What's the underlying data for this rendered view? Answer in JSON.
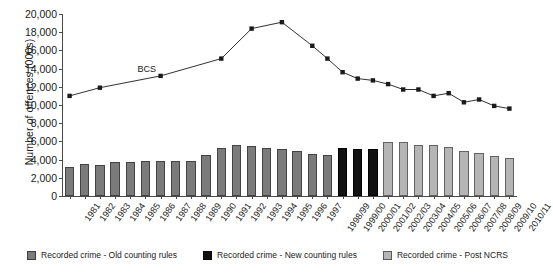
{
  "chart_data": {
    "type": "bar",
    "title": "",
    "xlabel": "",
    "ylabel": "Number of offences (000s)",
    "ylim": [
      0,
      20000
    ],
    "ytick_values": [
      0,
      2000,
      4000,
      6000,
      8000,
      10000,
      12000,
      14000,
      16000,
      18000,
      20000
    ],
    "ytick_labels": [
      "0",
      "2,000",
      "4,000",
      "6,000",
      "8,000",
      "10,000",
      "12,000",
      "14,000",
      "16,000",
      "18,000",
      "20,000"
    ],
    "grid": false,
    "legend_position": "bottom",
    "categories": [
      "1981",
      "1982",
      "1983",
      "1984",
      "1985",
      "1986",
      "1987",
      "1988",
      "1989",
      "1990",
      "1991",
      "1992",
      "1993",
      "1994",
      "1995",
      "1996",
      "1997",
      "1998/99",
      "1999/00",
      "2000/01",
      "2001/02",
      "2002/03",
      "2003/04",
      "2004/05",
      "2005/06",
      "2006/07",
      "2007/08",
      "2008/09",
      "2009/10",
      "2010/11"
    ],
    "series": [
      {
        "name": "Recorded crime - Old counting rules",
        "type": "bar",
        "color": "#7b7b7b",
        "values": [
          3200,
          3500,
          3400,
          3700,
          3750,
          3900,
          3900,
          3800,
          3900,
          4500,
          5300,
          5600,
          5500,
          5300,
          5200,
          5000,
          4600,
          4500,
          null,
          null,
          null,
          null,
          null,
          null,
          null,
          null,
          null,
          null,
          null,
          null
        ]
      },
      {
        "name": "Recorded crime - New counting rules",
        "type": "bar",
        "color": "#121212",
        "values": [
          null,
          null,
          null,
          null,
          null,
          null,
          null,
          null,
          null,
          null,
          null,
          null,
          null,
          null,
          null,
          null,
          null,
          null,
          5300,
          5200,
          5200,
          5500,
          null,
          null,
          null,
          null,
          null,
          null,
          null,
          null
        ]
      },
      {
        "name": "Recorded crime - Post NCRS",
        "type": "bar",
        "color": "#b5b5b5",
        "values": [
          null,
          null,
          null,
          null,
          null,
          null,
          null,
          null,
          null,
          null,
          null,
          null,
          null,
          null,
          null,
          null,
          null,
          null,
          null,
          null,
          null,
          5900,
          5900,
          5600,
          5600,
          5400,
          5000,
          4700,
          4400,
          4200
        ]
      },
      {
        "name": "BCS",
        "type": "line",
        "color": "#1a1a1a",
        "values": [
          11000,
          null,
          11900,
          null,
          null,
          null,
          13200,
          null,
          null,
          null,
          15100,
          null,
          18400,
          null,
          19100,
          null,
          16500,
          15100,
          13600,
          12900,
          12700,
          12300,
          11700,
          11700,
          11000,
          11300,
          10300,
          10600,
          9900,
          9600
        ]
      }
    ],
    "annotations": [
      {
        "text": "BCS",
        "category": "1986",
        "value": 13900
      }
    ]
  },
  "legend": {
    "items": [
      {
        "label": "Recorded crime - Old counting rules",
        "swatch": "old"
      },
      {
        "label": "Recorded crime - New counting rules",
        "swatch": "new"
      },
      {
        "label": "Recorded crime - Post NCRS",
        "swatch": "ncrs"
      }
    ]
  }
}
